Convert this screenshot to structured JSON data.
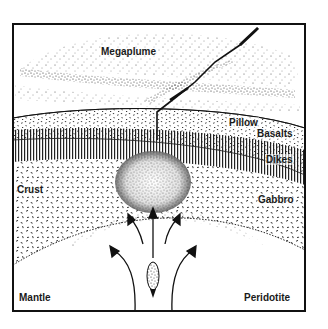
{
  "figure": {
    "type": "cross-section diagram",
    "colors": {
      "ink": "#1a1a1a",
      "paper": "#ffffff",
      "stipple": "#3a3a3a"
    }
  },
  "labels": {
    "megaplume": "Megaplume",
    "pillow": "Pillow",
    "basalts": "Basalts",
    "dikes": "Dikes",
    "crust": "Crust",
    "gabbro": "Gabbro",
    "mantle": "Mantle",
    "peridotite": "Peridotite"
  },
  "layers": [
    {
      "name": "Megaplume",
      "region": "ocean water above seafloor",
      "pattern": "sparse stipple"
    },
    {
      "name": "Pillow Basalts",
      "region": "upper crust",
      "pattern": "dense speckle"
    },
    {
      "name": "Dikes",
      "region": "sheeted dike complex",
      "pattern": "vertical lines"
    },
    {
      "name": "Gabbro",
      "region": "lower crust",
      "pattern": "dashes"
    },
    {
      "name": "Peridotite",
      "region": "mantle",
      "pattern": "blank"
    }
  ],
  "arrows": [
    {
      "direction": "up",
      "position": "center"
    },
    {
      "direction": "up-left",
      "position": "inner-left"
    },
    {
      "direction": "up-right",
      "position": "inner-right"
    },
    {
      "direction": "up-left",
      "position": "outer-left"
    },
    {
      "direction": "up-right",
      "position": "outer-right"
    }
  ]
}
